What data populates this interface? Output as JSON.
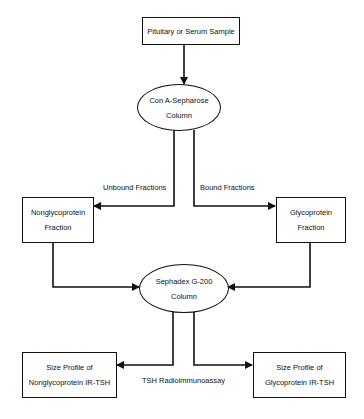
{
  "nodes": {
    "sample": {
      "label": "Pituitary or Serum Sample"
    },
    "con_a": {
      "line1": "Con A-Sepharose",
      "line2": "Column"
    },
    "nonglyco": {
      "line1": "Nonglycoprotein",
      "line2": "Fraction"
    },
    "glyco": {
      "line1": "Glycoprotein",
      "line2": "Fraction"
    },
    "sephadex": {
      "line1": "Sephadex G-200",
      "line2": "Column"
    },
    "profile_nonglyco": {
      "line1": "Size Profile of",
      "line2": "Nonglycoprotein IR-TSH"
    },
    "profile_glyco": {
      "line1": "Size Profile of",
      "line2": "Glycoprotein IR-TSH"
    }
  },
  "edge_labels": {
    "unbound": "Unbound Fractions",
    "bound": "Bound Fractions",
    "assay": "TSH Radioimmunoassay"
  }
}
